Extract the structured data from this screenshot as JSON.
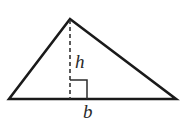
{
  "figure": {
    "kind": "geometry-diagram",
    "canvas": {
      "width": 185,
      "height": 134,
      "background": "#ffffff"
    },
    "stroke": {
      "triangle_color": "#1a1a1a",
      "triangle_width": 2.6,
      "dashed_color": "#333333",
      "dashed_width": 1.6,
      "dash_pattern": "4,3",
      "right_angle_color": "#2b2b2b",
      "right_angle_width": 1.5
    },
    "triangle": {
      "name": "triangle",
      "vertices": [
        {
          "name": "bottom-left",
          "x": 9,
          "y": 99
        },
        {
          "name": "apex",
          "x": 70,
          "y": 19
        },
        {
          "name": "bottom-right",
          "x": 176,
          "y": 99
        }
      ],
      "points_attr": "9,99 70,19 176,99"
    },
    "altitude": {
      "name": "altitude-dashed-line",
      "x1": 70,
      "y1": 20,
      "x2": 70,
      "y2": 99
    },
    "right_angle_marker": {
      "name": "right-angle-square",
      "points_attr": "70,80 87,80 87,99",
      "size": 17
    },
    "labels": {
      "height": {
        "text": "h",
        "x": 75,
        "y": 52,
        "color": "#2b2b2b"
      },
      "base": {
        "text": "b",
        "x": 83,
        "y": 102,
        "color": "#2b2b2b"
      }
    }
  }
}
